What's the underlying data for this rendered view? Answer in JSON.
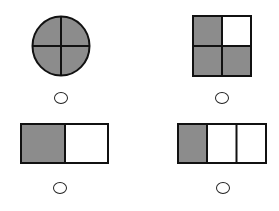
{
  "colors": {
    "shaded": "#8c8c8c",
    "unshaded": "#ffffff",
    "stroke": "#111111"
  },
  "options": [
    {
      "id": "A",
      "shape": "circle",
      "parts": 4,
      "shaded": 4,
      "fraction": "4/4"
    },
    {
      "id": "B",
      "shape": "square",
      "parts": 4,
      "shaded": 3,
      "fraction": "3/4"
    },
    {
      "id": "C",
      "shape": "rectangle",
      "parts": 2,
      "shaded": 1,
      "fraction": "1/2"
    },
    {
      "id": "D",
      "shape": "rectangle",
      "parts": 3,
      "shaded": 1,
      "fraction": "1/3"
    }
  ]
}
